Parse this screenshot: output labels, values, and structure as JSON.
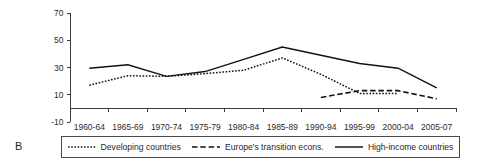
{
  "panel": {
    "label": "B"
  },
  "chart_data": {
    "type": "line",
    "title": "",
    "subtitle": "",
    "xlabel": "",
    "ylabel": "",
    "categories": [
      "1960-64",
      "1965-69",
      "1970-74",
      "1975-79",
      "1980-84",
      "1985-89",
      "1990-94",
      "1995-99",
      "2000-04",
      "2005-07"
    ],
    "ylim": [
      -10,
      70
    ],
    "yticks": [
      -10,
      10,
      30,
      50,
      70
    ],
    "ytick_labels": [
      "-10",
      "10",
      "30",
      "50",
      "70"
    ],
    "grid": false,
    "legend_position": "bottom",
    "series": [
      {
        "name": "Developing countries",
        "style": "dotted",
        "color": "#111111",
        "values": [
          17,
          24,
          23.5,
          25.5,
          28,
          37,
          25,
          11,
          11,
          null
        ]
      },
      {
        "name": "Europe's transition econs.",
        "style": "dashed",
        "color": "#111111",
        "values": [
          null,
          null,
          null,
          null,
          null,
          null,
          8,
          13,
          13,
          7
        ]
      },
      {
        "name": "High-income countries",
        "style": "solid",
        "color": "#111111",
        "values": [
          29.5,
          32,
          23.5,
          27,
          36,
          45,
          39,
          33,
          29.5,
          15
        ]
      }
    ]
  },
  "legend": {
    "items": [
      {
        "label": "Developing countries",
        "style": "dotted"
      },
      {
        "label": "Europe's transition econs.",
        "style": "dashed"
      },
      {
        "label": "High-income countries",
        "style": "solid"
      }
    ]
  }
}
